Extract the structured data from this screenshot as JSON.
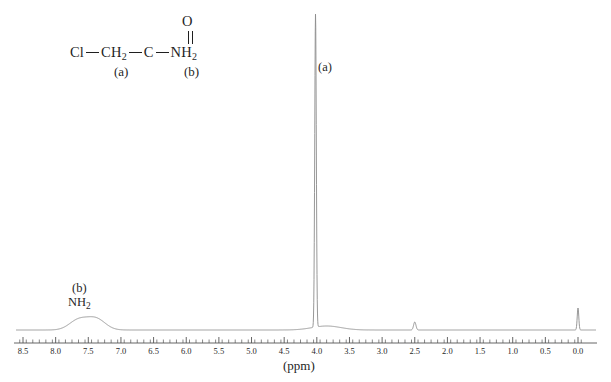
{
  "structure": {
    "name": "chloroacetamide-structure",
    "atoms": {
      "cl": "Cl",
      "ch2": "CH",
      "ch2_sub": "2",
      "c": "C",
      "o": "O",
      "nh2": "NH",
      "nh2_sub": "2"
    },
    "labels": {
      "a": "(a)",
      "b": "(b)"
    }
  },
  "spectrum": {
    "peak_label_a": "(a)",
    "peak_label_b": "(b)",
    "nh2_text": "NH",
    "nh2_sub": "2",
    "axis_unit": "(ppm)",
    "line_color": "#8c8c8c",
    "axis_color": "#555555",
    "text_color": "#1f1f1f"
  },
  "chart_data": {
    "type": "line",
    "title": "",
    "xlabel": "(ppm)",
    "ylabel": "",
    "xlim": [
      8.7,
      -0.25
    ],
    "grid": false,
    "legend": null,
    "axis_ticks_major": [
      8.5,
      8.0,
      7.5,
      7.0,
      6.5,
      6.0,
      5.5,
      5.0,
      4.5,
      4.0,
      3.5,
      3.0,
      2.5,
      2.0,
      1.5,
      1.0,
      0.5,
      0.0
    ],
    "tick_labels": [
      "8.5",
      "8.0",
      "7.5",
      "7.0",
      "6.5",
      "6.0",
      "5.5",
      "5.0",
      "4.5",
      "4.0",
      "3.5",
      "3.0",
      "2.5",
      "2.0",
      "1.5",
      "1.0",
      "0.5",
      "0.0"
    ],
    "minor_tick_interval": 0.1,
    "peaks": [
      {
        "id": "nh2-peak-1",
        "ppm": 7.65,
        "height": 10,
        "width": 0.14,
        "shape": "broad",
        "assignment": "b"
      },
      {
        "id": "nh2-peak-2",
        "ppm": 7.38,
        "height": 11,
        "width": 0.14,
        "shape": "broad",
        "assignment": "b"
      },
      {
        "id": "ch2-peak",
        "ppm": 4.02,
        "height": 313,
        "width": 0.012,
        "shape": "sharp",
        "assignment": "a"
      },
      {
        "id": "solvent-hump",
        "ppm": 3.85,
        "height": 4,
        "width": 0.22,
        "shape": "broad",
        "assignment": ""
      },
      {
        "id": "dmso-peak",
        "ppm": 2.5,
        "height": 8,
        "width": 0.018,
        "shape": "sharp",
        "assignment": ""
      },
      {
        "id": "tms-peak",
        "ppm": 0.0,
        "height": 22,
        "width": 0.012,
        "shape": "sharp",
        "assignment": ""
      }
    ],
    "baseline_y_ppm_value": 0,
    "annotations": [
      {
        "text": "(a)",
        "ppm": 3.78,
        "y_frac": 0.82
      },
      {
        "text": "(b)",
        "ppm": 7.55,
        "y_frac": 0.26
      },
      {
        "text": "NH2",
        "ppm": 7.55,
        "y_frac": 0.2
      }
    ]
  }
}
